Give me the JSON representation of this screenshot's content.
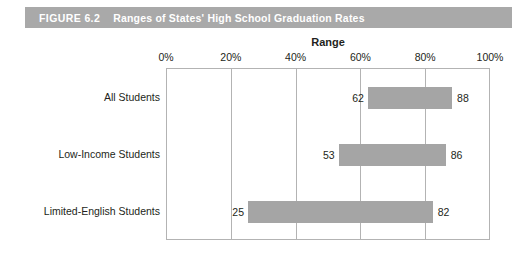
{
  "caption": {
    "figure_number": "FIGURE 6.2",
    "title": "Ranges of States' High School Graduation Rates",
    "band_color": "#a9a9a9",
    "text_color": "#ffffff"
  },
  "chart_data": {
    "type": "bar",
    "orientation": "horizontal",
    "subtype": "range-bar",
    "title": "Ranges of States' High School Graduation Rates",
    "xlabel": "Range",
    "ylabel": "",
    "xlim": [
      0,
      100
    ],
    "xticks": [
      0,
      20,
      40,
      60,
      80,
      100
    ],
    "xticklabels": [
      "0%",
      "20%",
      "40%",
      "60%",
      "80%",
      "100%"
    ],
    "grid": true,
    "legend": false,
    "bar_color": "#a5a5a5",
    "categories": [
      "All Students",
      "Low-Income Students",
      "Limited-English Students"
    ],
    "ranges": [
      {
        "category": "All Students",
        "low": 62,
        "high": 88,
        "low_label": "62",
        "high_label": "88"
      },
      {
        "category": "Low-Income Students",
        "low": 53,
        "high": 86,
        "low_label": "53",
        "high_label": "86"
      },
      {
        "category": "Limited-English Students",
        "low": 25,
        "high": 82,
        "low_label": "25",
        "high_label": "82"
      }
    ]
  }
}
